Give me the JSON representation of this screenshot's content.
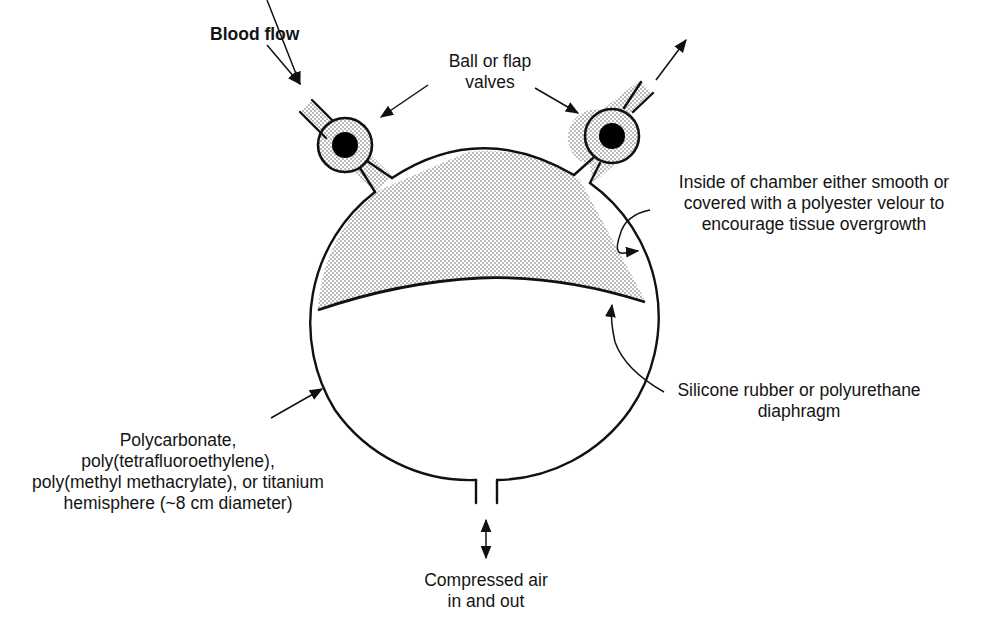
{
  "diagram": {
    "type": "labeled-schematic",
    "colors": {
      "stroke": "#111111",
      "stipple_fill": "#d8d8d8",
      "ball": "#000000",
      "background": "#ffffff"
    },
    "components": [
      {
        "id": "inlet-port",
        "label": "Blood flow"
      },
      {
        "id": "valves",
        "label": "Ball or flap valves"
      },
      {
        "id": "outlet-port"
      },
      {
        "id": "blood-chamber"
      },
      {
        "id": "diaphragm"
      },
      {
        "id": "air-chamber-housing"
      },
      {
        "id": "air-port"
      }
    ]
  },
  "labels": {
    "blood_flow": "Blood flow",
    "valves": [
      "Ball or flap",
      "valves"
    ],
    "chamber_inside": [
      "Inside of chamber either smooth or",
      "covered with a polyester velour to",
      "encourage tissue overgrowth"
    ],
    "diaphragm": [
      "Silicone rubber or polyurethane",
      "diaphragm"
    ],
    "housing": [
      "Polycarbonate,",
      "poly(tetrafluoroethylene),",
      "poly(methyl methacrylate), or titanium",
      "hemisphere (~8 cm diameter)"
    ],
    "air": [
      "Compressed air",
      "in and out"
    ]
  }
}
